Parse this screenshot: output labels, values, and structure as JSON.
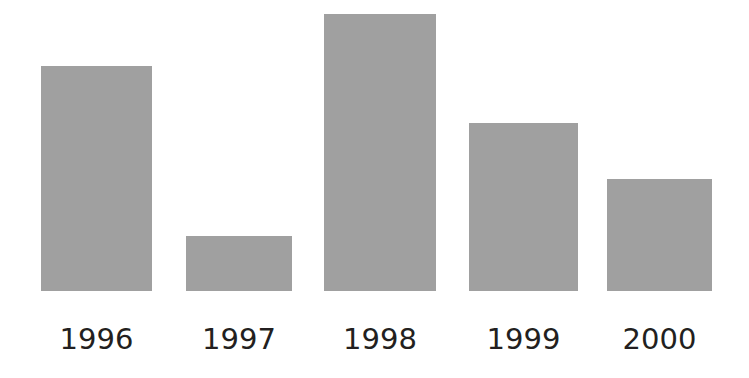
{
  "chart_data": {
    "type": "bar",
    "title": "",
    "subtitle": "",
    "xlabel": "",
    "ylabel": "",
    "categories": [
      "1996",
      "1997",
      "1998",
      "1999",
      "2000"
    ],
    "values": [
      81,
      20,
      100,
      61,
      40
    ],
    "ylim": [
      0,
      100
    ],
    "grid": false,
    "legend": null,
    "legend_position": "none",
    "bar_color": "#a0a0a0",
    "label_color": "#231f20",
    "background": "#ffffff",
    "axis_line": false,
    "tick_labels_y": [],
    "annotations": [],
    "bars": [
      {
        "category": "1996",
        "value": 81,
        "x": 41,
        "width": 111,
        "top": 66,
        "height": 225
      },
      {
        "category": "1997",
        "value": 20,
        "x": 186,
        "width": 106,
        "top": 236,
        "height": 55
      },
      {
        "category": "1998",
        "value": 100,
        "x": 324,
        "width": 112,
        "top": 14,
        "height": 277
      },
      {
        "category": "1999",
        "value": 61,
        "x": 469,
        "width": 109,
        "top": 123,
        "height": 168
      },
      {
        "category": "2000",
        "value": 40,
        "x": 607,
        "width": 105,
        "top": 179,
        "height": 112
      }
    ],
    "baseline_y": 291,
    "label_y": 322
  }
}
